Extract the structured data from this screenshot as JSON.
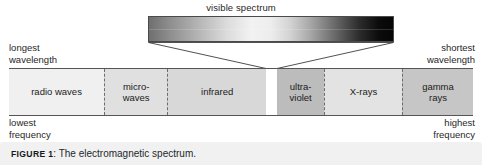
{
  "figure": {
    "visible_spectrum_label": "visible spectrum",
    "caption": {
      "tag": "FIGURE",
      "number": "1",
      "separator": ":",
      "text": "The electromagnetic spectrum."
    }
  },
  "corner_labels": {
    "top_left": "longest\nwavelength",
    "top_right": "shortest\nwavelength",
    "bottom_left": "lowest\nfrequency",
    "bottom_right": "highest\nfrequency"
  },
  "bands": [
    {
      "id": "radio-waves",
      "label": "radio waves",
      "left_pct": 0.0,
      "width_pct": 20.5,
      "shade": "#f0f0f0"
    },
    {
      "id": "microwaves",
      "label": "micro-\nwaves",
      "left_pct": 20.5,
      "width_pct": 13.6,
      "shade": "#e0e0e0"
    },
    {
      "id": "infrared",
      "label": "infrared",
      "left_pct": 34.1,
      "width_pct": 21.3,
      "shade": "#d8d8d8"
    },
    {
      "id": "visible-gap",
      "label": "",
      "left_pct": 55.4,
      "width_pct": 2.4,
      "shade": "#ffffff"
    },
    {
      "id": "ultraviolet",
      "label": "ultra-\nviolet",
      "left_pct": 57.8,
      "width_pct": 10.1,
      "shade": "#bcbcbc"
    },
    {
      "id": "x-rays",
      "label": "X-rays",
      "left_pct": 67.9,
      "width_pct": 16.8,
      "shade": "#e3e3e3"
    },
    {
      "id": "gamma-rays",
      "label": "gamma\nrays",
      "left_pct": 84.7,
      "width_pct": 15.3,
      "shade": "#c6c6c6"
    }
  ],
  "chart_data": {
    "type": "bar",
    "title": "The electromagnetic spectrum",
    "orientation": "horizontal",
    "xlabel": "wavelength (decreasing to the right) / frequency (increasing to the right)",
    "ylabel": "",
    "grid": false,
    "legend": "none",
    "axis_endpoints": {
      "left_top": "longest wavelength",
      "right_top": "shortest wavelength",
      "left_bottom": "lowest frequency",
      "right_bottom": "highest frequency"
    },
    "categories": [
      "radio waves",
      "micro-waves",
      "infrared",
      "visible",
      "ultra-violet",
      "X-rays",
      "gamma rays"
    ],
    "series": [
      {
        "name": "relative band width along spectrum axis (%)",
        "values": [
          20.5,
          13.6,
          21.3,
          2.4,
          10.1,
          16.8,
          15.3
        ]
      }
    ],
    "annotations": [
      "visible spectrum (callout bar expanded above the visible band)"
    ],
    "callout": {
      "label": "visible spectrum",
      "source_category": "visible",
      "gradient_description": "continuous grayscale gradient, mid-gray at left through near-white at center to black at right"
    }
  },
  "colors": {
    "outline": "#555555",
    "divider": "#6d6d6d",
    "caption_background": "#f1f1f1",
    "text": "#1f1f1f",
    "page_background": "#ffffff"
  }
}
